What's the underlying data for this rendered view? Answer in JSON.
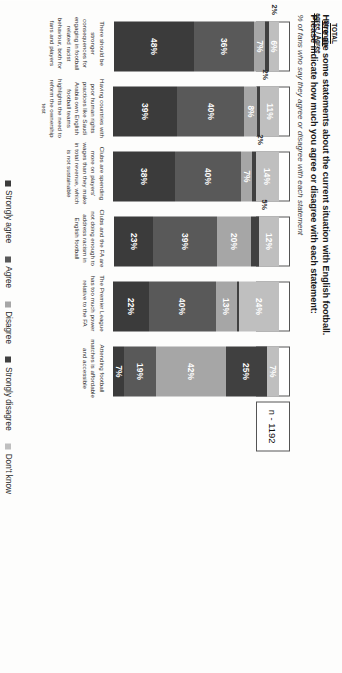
{
  "header": {
    "title_line1": "Here are some statements about the current situation with English football.",
    "title_line2": "Please indicate how much you agree or disagree with each statement:",
    "subtitle": "% of fans who say they agree or disagree with each statement",
    "total_header_line1": "TOTAL Strongly",
    "total_header_line2": "agree / Agree",
    "base": "n - 1192"
  },
  "legend": {
    "items": [
      {
        "label": "Strongly agree",
        "color": "#3b3b3b"
      },
      {
        "label": "Agree",
        "color": "#595959"
      },
      {
        "label": "Disagree",
        "color": "#a6a6a6"
      },
      {
        "label": "Strongly disagree",
        "color": "#404040"
      },
      {
        "label": "Don't know",
        "color": "#bfbfbf"
      }
    ]
  },
  "chart_data": {
    "type": "bar",
    "title": "Here are some statements about the current situation with English football. Please indicate how much you agree or disagree with each statement:",
    "subtitle": "% of fans who say they agree or disagree with each statement",
    "xlabel": "",
    "ylabel": "",
    "ylim": [
      0,
      100
    ],
    "stacked": true,
    "orientation": "vertical",
    "grid": false,
    "legend_position": "bottom",
    "categories": [
      "There should be stronger consequences for engaging in football related racist behaviour, both for fans and players",
      "Having countries with poor human rights practices like Saudi Arabia own English football teams highlights the need to reform the ownership test",
      "Clubs are spending more on players' wages than they make in total revenue, which is not sustainable",
      "Clubs and the FA are not doing enough to address racism in English football",
      "The Premier League has too much power relative to the FA",
      "Attending football matches is affordable and accessible"
    ],
    "series": [
      {
        "name": "Strongly agree",
        "color": "#3b3b3b",
        "values": [
          48,
          39,
          38,
          23,
          22,
          7
        ]
      },
      {
        "name": "Agree",
        "color": "#595959",
        "values": [
          36,
          40,
          40,
          39,
          40,
          19
        ]
      },
      {
        "name": "Disagree",
        "color": "#a6a6a6",
        "values": [
          7,
          8,
          7,
          20,
          13,
          42
        ]
      },
      {
        "name": "Strongly disagree",
        "color": "#404040",
        "values": [
          2,
          2,
          2,
          5,
          1,
          25
        ]
      },
      {
        "name": "Don't know",
        "color": "#bfbfbf",
        "values": [
          6,
          11,
          14,
          12,
          24,
          7
        ]
      }
    ],
    "totals": [
      "85%",
      "79%",
      "77%",
      "63%",
      "62%",
      "26%"
    ],
    "base_note": "n - 1192"
  },
  "bars": [
    {
      "total": "85%",
      "category": "There should be stronger consequences for engaging in football related racist behaviour, both for fans and players",
      "segments": [
        {
          "name": "Don't know",
          "value": 6,
          "label": "6%",
          "inside": true
        },
        {
          "name": "Strongly disagree",
          "value": 2,
          "label": "2%",
          "inside": false
        },
        {
          "name": "Disagree",
          "value": 7,
          "label": "7%",
          "inside": true
        },
        {
          "name": "Agree",
          "value": 36,
          "label": "36%",
          "inside": true
        },
        {
          "name": "Strongly agree",
          "value": 48,
          "label": "48%",
          "inside": true
        }
      ]
    },
    {
      "total": "79%",
      "category": "Having countries with poor human rights practices like Saudi Arabia own English football teams highlights the need to reform the ownership test",
      "segments": [
        {
          "name": "Don't know",
          "value": 11,
          "label": "11%",
          "inside": true
        },
        {
          "name": "Strongly disagree",
          "value": 2,
          "label": "2%",
          "inside": false
        },
        {
          "name": "Disagree",
          "value": 8,
          "label": "8%",
          "inside": true
        },
        {
          "name": "Agree",
          "value": 40,
          "label": "40%",
          "inside": true
        },
        {
          "name": "Strongly agree",
          "value": 39,
          "label": "39%",
          "inside": true
        }
      ]
    },
    {
      "total": "77%",
      "category": "Clubs are spending more on players' wages than they make in total revenue, which is not sustainable",
      "segments": [
        {
          "name": "Don't know",
          "value": 14,
          "label": "14%",
          "inside": true
        },
        {
          "name": "Strongly disagree",
          "value": 2,
          "label": "2%",
          "inside": false
        },
        {
          "name": "Disagree",
          "value": 7,
          "label": "7%",
          "inside": true
        },
        {
          "name": "Agree",
          "value": 40,
          "label": "40%",
          "inside": true
        },
        {
          "name": "Strongly agree",
          "value": 38,
          "label": "38%",
          "inside": true
        }
      ]
    },
    {
      "total": "63%",
      "category": "Clubs and the FA are not doing enough to address racism in English football",
      "segments": [
        {
          "name": "Don't know",
          "value": 12,
          "label": "12%",
          "inside": true
        },
        {
          "name": "Strongly disagree",
          "value": 5,
          "label": "5%",
          "inside": false
        },
        {
          "name": "Disagree",
          "value": 20,
          "label": "20%",
          "inside": true
        },
        {
          "name": "Agree",
          "value": 39,
          "label": "39%",
          "inside": true
        },
        {
          "name": "Strongly agree",
          "value": 23,
          "label": "23%",
          "inside": true
        }
      ]
    },
    {
      "total": "62%",
      "category": "The Premier League has too much power relative to the FA",
      "segments": [
        {
          "name": "Don't know",
          "value": 24,
          "label": "24%",
          "inside": true
        },
        {
          "name": "Strongly disagree",
          "value": 1,
          "label": "1%",
          "inside": true
        },
        {
          "name": "Disagree",
          "value": 13,
          "label": "13%",
          "inside": true
        },
        {
          "name": "Agree",
          "value": 40,
          "label": "40%",
          "inside": true
        },
        {
          "name": "Strongly agree",
          "value": 22,
          "label": "22%",
          "inside": true
        }
      ]
    },
    {
      "total": "26%",
      "category": "Attending football matches is affordable and accessible",
      "segments": [
        {
          "name": "Don't know",
          "value": 7,
          "label": "7%",
          "inside": true
        },
        {
          "name": "Strongly disagree",
          "value": 25,
          "label": "25%",
          "inside": true
        },
        {
          "name": "Disagree",
          "value": 42,
          "label": "42%",
          "inside": true
        },
        {
          "name": "Agree",
          "value": 19,
          "label": "19%",
          "inside": true
        },
        {
          "name": "Strongly agree",
          "value": 7,
          "label": "7%",
          "inside": true
        }
      ]
    }
  ]
}
